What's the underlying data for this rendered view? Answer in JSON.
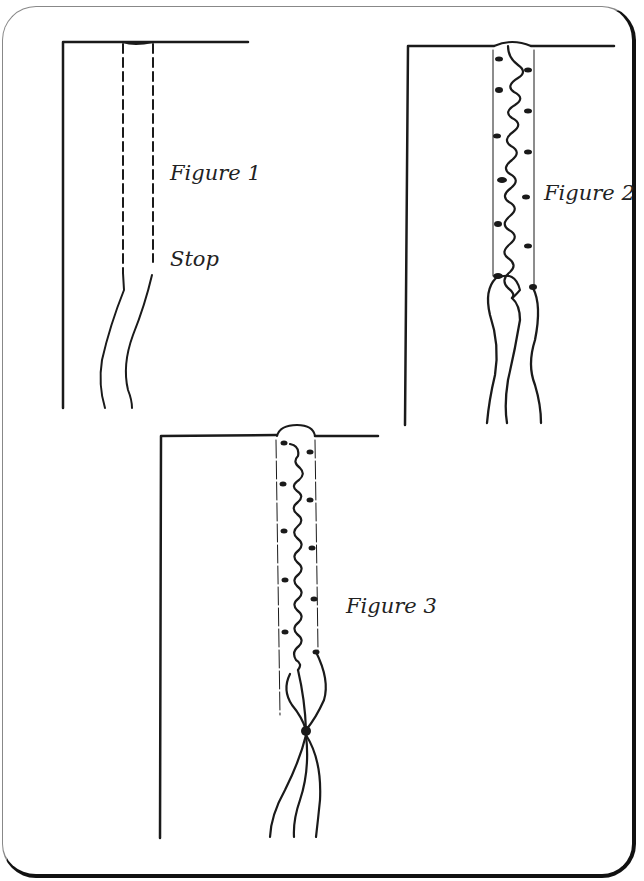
{
  "figures": [
    {
      "id": 1,
      "label": "Figure 1",
      "annotation": "Stop"
    },
    {
      "id": 2,
      "label": "Figure 2"
    },
    {
      "id": 3,
      "label": "Figure 3"
    }
  ],
  "colors": {
    "ink": "#1a1a1a",
    "background": "#ffffff",
    "card_border": "#111111"
  }
}
